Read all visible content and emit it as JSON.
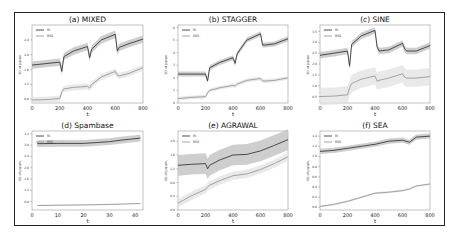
{
  "chart_data": [
    {
      "type": "line",
      "title": "(a) MIXED",
      "xlabel": "t",
      "ylabel": "SD of param.",
      "xlim": [
        0,
        800
      ],
      "ylim": [
        0.7,
        2.8
      ],
      "xticks": [
        0,
        200,
        400,
        600,
        800
      ],
      "yticks": [
        0.8,
        1.2,
        1.6,
        2.0,
        2.4
      ],
      "legend": {
        "position": "top-left",
        "entries": [
          "RI",
          "RSS"
        ]
      },
      "x": [
        0,
        100,
        200,
        215,
        230,
        300,
        400,
        415,
        430,
        500,
        600,
        615,
        630,
        700,
        800
      ],
      "series": [
        {
          "name": "RI",
          "values": [
            1.72,
            1.76,
            1.8,
            1.55,
            1.95,
            2.1,
            2.22,
            1.92,
            2.15,
            2.4,
            2.55,
            2.1,
            2.2,
            2.3,
            2.42
          ],
          "band": 0.1
        },
        {
          "name": "RSS",
          "values": [
            0.78,
            0.79,
            0.82,
            1.0,
            1.08,
            1.12,
            1.15,
            1.1,
            1.2,
            1.4,
            1.55,
            1.45,
            1.43,
            1.5,
            1.65
          ],
          "band": 0.08
        }
      ]
    },
    {
      "type": "line",
      "title": "(b) STAGGER",
      "xlabel": "t",
      "ylabel": "SD of param.",
      "xlim": [
        0,
        800
      ],
      "ylim": [
        0,
        6.2
      ],
      "xticks": [
        0,
        200,
        400,
        600,
        800
      ],
      "yticks": [
        0,
        1,
        2,
        3,
        4,
        5,
        6
      ],
      "legend": {
        "position": "top-left",
        "entries": [
          "RI",
          "RSS"
        ]
      },
      "x": [
        0,
        100,
        200,
        215,
        230,
        300,
        400,
        415,
        430,
        500,
        600,
        615,
        630,
        700,
        800
      ],
      "series": [
        {
          "name": "RI",
          "values": [
            2.3,
            2.3,
            2.3,
            1.75,
            2.8,
            3.2,
            3.6,
            3.15,
            3.9,
            5.0,
            5.5,
            4.6,
            4.6,
            4.7,
            5.1
          ],
          "band": 0.2
        },
        {
          "name": "RSS",
          "values": [
            0.35,
            0.45,
            0.5,
            0.8,
            1.0,
            1.2,
            1.4,
            1.35,
            1.5,
            1.8,
            1.95,
            1.75,
            1.75,
            1.8,
            2.0
          ],
          "band": 0.15
        }
      ]
    },
    {
      "type": "line",
      "title": "(c) SINE",
      "xlabel": "t",
      "ylabel": "SD of param.",
      "xlim": [
        0,
        800
      ],
      "ylim": [
        0.2,
        3.8
      ],
      "xticks": [
        0,
        200,
        400,
        600,
        800
      ],
      "yticks": [
        0.5,
        1.0,
        1.5,
        2.0,
        2.5,
        3.0,
        3.5
      ],
      "legend": {
        "position": "top-left",
        "entries": [
          "RI",
          "RSS"
        ]
      },
      "x": [
        0,
        100,
        200,
        215,
        230,
        300,
        400,
        415,
        430,
        500,
        600,
        615,
        630,
        700,
        800
      ],
      "series": [
        {
          "name": "RI",
          "values": [
            2.4,
            2.5,
            2.6,
            1.9,
            2.9,
            3.3,
            3.55,
            2.8,
            2.6,
            2.65,
            2.95,
            2.7,
            2.6,
            2.6,
            2.85
          ],
          "band": 0.15
        },
        {
          "name": "RSS",
          "values": [
            0.5,
            0.52,
            0.58,
            0.9,
            1.1,
            1.3,
            1.45,
            1.2,
            1.25,
            1.35,
            1.55,
            1.4,
            1.35,
            1.35,
            1.42
          ],
          "band": 0.4
        }
      ]
    },
    {
      "type": "line",
      "title": "(d) Spambase",
      "xlabel": "t",
      "ylabel": "SD of param.",
      "xlim": [
        0,
        43
      ],
      "ylim": [
        0.5,
        3.3
      ],
      "xticks": [
        0,
        10,
        20,
        30,
        40
      ],
      "yticks": [
        0.8,
        1.2,
        1.6,
        2.0,
        2.4,
        2.8,
        3.2
      ],
      "legend": {
        "position": "top-left",
        "entries": [
          "RI",
          "RSS"
        ]
      },
      "x": [
        2,
        10,
        20,
        30,
        35,
        42
      ],
      "series": [
        {
          "name": "RI",
          "values": [
            2.85,
            2.86,
            2.86,
            2.92,
            2.98,
            3.05
          ],
          "band": 0.12
        },
        {
          "name": "RSS",
          "values": [
            0.66,
            0.67,
            0.68,
            0.7,
            0.71,
            0.73
          ],
          "band": 0.02
        }
      ]
    },
    {
      "type": "line",
      "title": "(e) AGRAWAL",
      "xlabel": "t",
      "ylabel": "SD of param.",
      "xlim": [
        0,
        800
      ],
      "ylim": [
        0.0,
        2.3
      ],
      "xticks": [
        0,
        200,
        400,
        600,
        800
      ],
      "yticks": [
        0.0,
        0.4,
        0.8,
        1.2,
        1.6,
        2.0
      ],
      "legend": {
        "position": "top-left",
        "entries": [
          "RI",
          "RSS"
        ]
      },
      "x": [
        0,
        100,
        200,
        215,
        230,
        300,
        400,
        500,
        600,
        700,
        800
      ],
      "series": [
        {
          "name": "RI",
          "values": [
            1.3,
            1.33,
            1.35,
            1.2,
            1.3,
            1.45,
            1.6,
            1.62,
            1.72,
            1.88,
            2.05
          ],
          "band": 0.3
        },
        {
          "name": "RSS",
          "values": [
            0.2,
            0.42,
            0.6,
            0.68,
            0.72,
            0.85,
            1.0,
            1.05,
            1.18,
            1.35,
            1.55
          ],
          "band": 0.12
        }
      ]
    },
    {
      "type": "line",
      "title": "(f) SEA",
      "xlabel": "t",
      "ylabel": "SD of param.",
      "xlim": [
        0,
        800
      ],
      "ylim": [
        -0.05,
        1.5
      ],
      "xticks": [
        0,
        200,
        400,
        600,
        800
      ],
      "yticks": [
        0.0,
        0.2,
        0.4,
        0.6,
        0.8,
        1.0,
        1.2,
        1.4
      ],
      "legend": {
        "position": "top-left",
        "entries": [
          "RI",
          "RSS"
        ]
      },
      "x": [
        0,
        100,
        200,
        300,
        400,
        500,
        600,
        650,
        700,
        800
      ],
      "series": [
        {
          "name": "RI",
          "values": [
            1.1,
            1.12,
            1.16,
            1.2,
            1.24,
            1.3,
            1.32,
            1.28,
            1.38,
            1.4
          ],
          "band": 0.05
        },
        {
          "name": "RSS",
          "values": [
            0.02,
            0.06,
            0.12,
            0.2,
            0.28,
            0.3,
            0.33,
            0.36,
            0.42,
            0.46
          ],
          "band": 0.02
        }
      ]
    }
  ],
  "colors": {
    "RI": "#3a3a3a",
    "RSS": "#9a9a9a",
    "RI_band": "#bdbdbd",
    "RSS_band": "#e2e2e2"
  }
}
